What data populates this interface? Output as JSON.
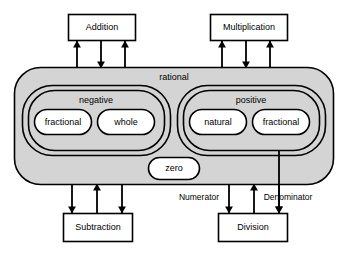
{
  "diagram": {
    "colors": {
      "fill_gray": "#d4d4d4",
      "fill_white": "#ffffff",
      "stroke": "#000000",
      "background": "#ffffff"
    },
    "operations": {
      "addition": {
        "label": "Addition"
      },
      "multiplication": {
        "label": "Multiplication"
      },
      "subtraction": {
        "label": "Subtraction"
      },
      "division": {
        "label": "Division"
      }
    },
    "sets": {
      "rational": {
        "label": "rational"
      },
      "negative": {
        "label": "negative"
      },
      "positive": {
        "label": "positive"
      },
      "zero": {
        "label": "zero"
      },
      "negative_fractional": {
        "label": "fractional"
      },
      "negative_whole": {
        "label": "whole"
      },
      "positive_natural": {
        "label": "natural"
      },
      "positive_fractional": {
        "label": "fractional"
      }
    },
    "edge_labels": {
      "numerator": "Numerator",
      "denominator": "Denominator"
    }
  }
}
